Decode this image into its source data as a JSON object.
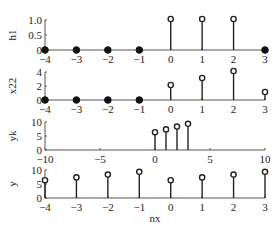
{
  "chart_data": [
    {
      "type": "stem",
      "ylabel": "h1",
      "xlim": [
        -4,
        3
      ],
      "ylim": [
        0,
        1.0
      ],
      "xticks": [
        "-4",
        "-3",
        "-2",
        "-1",
        "0",
        "1",
        "2",
        "3"
      ],
      "yticks": [
        "0",
        "0.5",
        "1.0"
      ],
      "x": [
        -4,
        -3,
        -2,
        -1,
        0,
        1,
        2,
        3
      ],
      "values": [
        0,
        0,
        0,
        0,
        1,
        1,
        1,
        0
      ]
    },
    {
      "type": "stem",
      "ylabel": "x22",
      "xlim": [
        -4,
        3
      ],
      "ylim": [
        0,
        4
      ],
      "xticks": [
        "-4",
        "-3",
        "-2",
        "-1",
        "0",
        "1",
        "2",
        "3"
      ],
      "yticks": [
        "0",
        "2",
        "4"
      ],
      "x": [
        -4,
        -3,
        -2,
        -1,
        0,
        1,
        2,
        3
      ],
      "values": [
        0,
        0,
        0,
        0,
        2,
        3,
        4,
        1
      ]
    },
    {
      "type": "stem",
      "ylabel": "yk",
      "xlim": [
        -10,
        10
      ],
      "ylim": [
        0,
        10
      ],
      "xticks": [
        "-10",
        "-5",
        "0",
        "5",
        "10"
      ],
      "yticks": [
        "0",
        "5",
        "10"
      ],
      "x": [
        0,
        1,
        2,
        3
      ],
      "values": [
        6,
        7,
        8,
        9
      ]
    },
    {
      "type": "stem",
      "ylabel": "y",
      "xlabel": "nx",
      "xlim": [
        -4,
        3
      ],
      "ylim": [
        0,
        10
      ],
      "xticks": [
        "-4",
        "-3",
        "-2",
        "-1",
        "0",
        "1",
        "2",
        "3"
      ],
      "yticks": [
        "0",
        "5",
        "10"
      ],
      "x": [
        -4,
        -3,
        -2,
        -1,
        0,
        1,
        2,
        3
      ],
      "values": [
        6,
        7,
        8,
        9,
        6,
        7,
        8,
        9
      ]
    }
  ],
  "style": {
    "stem_color": "#222222",
    "axis_color": "#555555"
  }
}
